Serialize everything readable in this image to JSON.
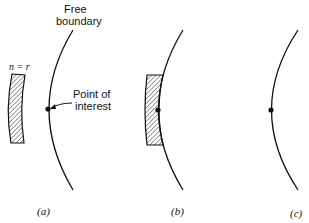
{
  "diagram": {
    "annotations": {
      "free_boundary_line1": "Free",
      "free_boundary_line2": "boundary",
      "point_line1": "Point of",
      "point_line2": "interest",
      "region_label": "n = r"
    },
    "panels": [
      {
        "id": "a",
        "caption": "(a)",
        "description": "Free boundary arc with point of interest; hatched region n = r located away from the boundary"
      },
      {
        "id": "b",
        "caption": "(b)",
        "description": "Hatched region adjacent to the free boundary, touching the point of interest"
      },
      {
        "id": "c",
        "caption": "(c)",
        "description": "Free boundary arc with point of interest only"
      }
    ],
    "colors": {
      "stroke": "#111111",
      "background": "#ffffff"
    }
  }
}
